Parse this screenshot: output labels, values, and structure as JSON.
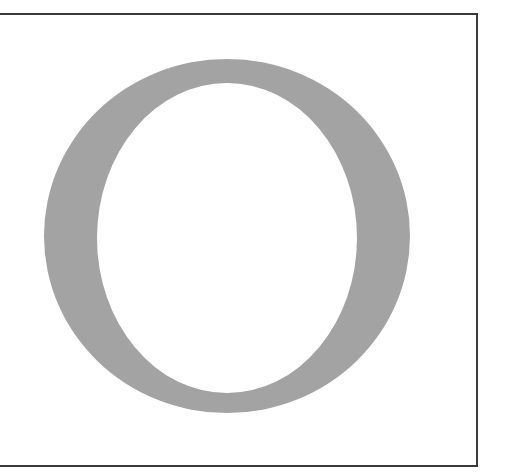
{
  "image": {
    "description": "Large grey serif capital letter inside a bordered frame",
    "letter": "O",
    "colors": {
      "letter_fill": "#a3a3a3",
      "frame_stroke": "#3a3a3a",
      "background": "#ffffff"
    }
  }
}
